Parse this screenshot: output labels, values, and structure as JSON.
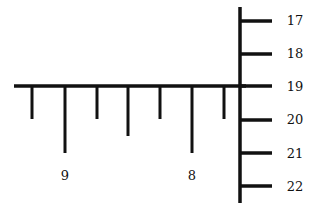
{
  "diagram": {
    "type": "ruler-scales",
    "stroke_color": "#111111",
    "horizontal_ruler": {
      "line": {
        "x1": 14,
        "x2": 246,
        "y": 86
      },
      "ticks": [
        {
          "x": 32,
          "length": "short",
          "y_end": 119
        },
        {
          "x": 65,
          "length": "long",
          "y_end": 153
        },
        {
          "x": 97,
          "length": "short",
          "y_end": 119
        },
        {
          "x": 128,
          "length": "medium",
          "y_end": 136
        },
        {
          "x": 160,
          "length": "short",
          "y_end": 119
        },
        {
          "x": 192,
          "length": "long",
          "y_end": 153
        },
        {
          "x": 224,
          "length": "short",
          "y_end": 119
        }
      ],
      "labels": [
        {
          "text": "9",
          "x": 65,
          "y": 180
        },
        {
          "text": "8",
          "x": 192,
          "y": 180
        }
      ]
    },
    "vertical_ruler": {
      "line": {
        "x": 240,
        "y1": 7,
        "y2": 203
      },
      "ticks": [
        {
          "y": 21,
          "x_end": 272
        },
        {
          "y": 54,
          "x_end": 272
        },
        {
          "y": 86,
          "x_end": 272
        },
        {
          "y": 120,
          "x_end": 272
        },
        {
          "y": 153,
          "x_end": 272
        },
        {
          "y": 186,
          "x_end": 272
        }
      ],
      "labels": [
        {
          "text": "17",
          "x": 295,
          "y": 25
        },
        {
          "text": "18",
          "x": 295,
          "y": 58
        },
        {
          "text": "19",
          "x": 295,
          "y": 91
        },
        {
          "text": "20",
          "x": 295,
          "y": 124
        },
        {
          "text": "21",
          "x": 295,
          "y": 158
        },
        {
          "text": "22",
          "x": 295,
          "y": 191
        }
      ]
    }
  }
}
